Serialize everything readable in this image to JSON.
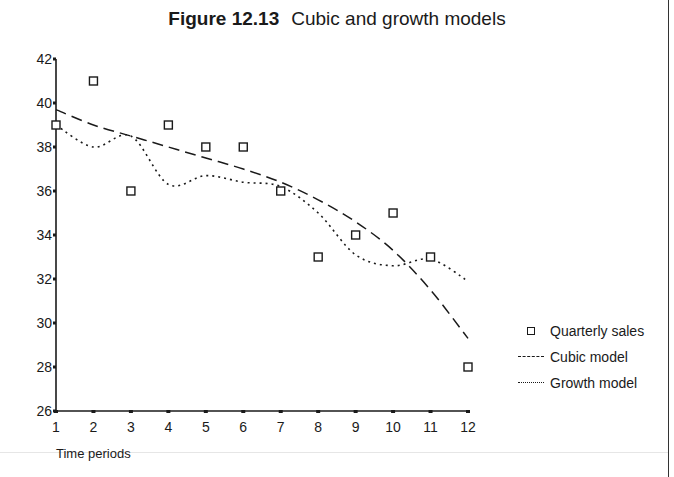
{
  "figure": {
    "number": "Figure 12.13",
    "title": "Cubic and growth models",
    "xlabel": "Time periods"
  },
  "legend": [
    {
      "label": "Quarterly sales",
      "symbol": "square-marker"
    },
    {
      "label": "Cubic model",
      "symbol": "dashed-line"
    },
    {
      "label": "Growth model",
      "symbol": "dotted-line"
    }
  ],
  "axes": {
    "y_ticks": [
      "26",
      "28",
      "30",
      "32",
      "34",
      "36",
      "38",
      "40",
      "42"
    ],
    "x_ticks": [
      "1",
      "2",
      "3",
      "4",
      "5",
      "6",
      "7",
      "8",
      "9",
      "10",
      "11",
      "12"
    ]
  },
  "chart_data": {
    "type": "line",
    "xlabel": "Time periods",
    "ylabel": "",
    "x": [
      1,
      2,
      3,
      4,
      5,
      6,
      7,
      8,
      9,
      10,
      11,
      12
    ],
    "xlim": [
      1,
      12
    ],
    "ylim": [
      26,
      42
    ],
    "y_ticks": [
      26,
      28,
      30,
      32,
      34,
      36,
      38,
      40,
      42
    ],
    "grid": false,
    "legend_position": "right",
    "series": [
      {
        "name": "Quarterly sales",
        "style": "square markers",
        "values": [
          39,
          41,
          36,
          39,
          38,
          38,
          36,
          33,
          34,
          35,
          33,
          28
        ]
      },
      {
        "name": "Cubic model",
        "style": "dashed line",
        "values": [
          39.7,
          39.0,
          38.5,
          38.0,
          37.5,
          37.0,
          36.4,
          35.6,
          34.6,
          33.3,
          31.5,
          29.3
        ]
      },
      {
        "name": "Growth model",
        "style": "dotted line",
        "values": [
          39.0,
          38.0,
          38.5,
          36.3,
          36.7,
          36.4,
          36.2,
          35.0,
          33.1,
          32.6,
          32.9,
          31.9
        ]
      }
    ]
  }
}
